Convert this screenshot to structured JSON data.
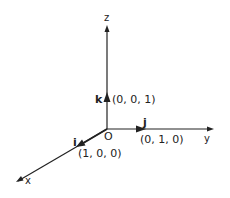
{
  "diagram": {
    "type": "3d-coordinate-axes",
    "axes": {
      "x": "x",
      "y": "y",
      "z": "z"
    },
    "origin_label": "O",
    "unit_vectors": [
      {
        "name": "i",
        "coords": "(1, 0, 0)",
        "axis": "x"
      },
      {
        "name": "j",
        "coords": "(0, 1, 0)",
        "axis": "y"
      },
      {
        "name": "k",
        "coords": "(0, 0, 1)",
        "axis": "z"
      }
    ],
    "colors": {
      "ink": "#222222",
      "background": "#ffffff"
    }
  }
}
